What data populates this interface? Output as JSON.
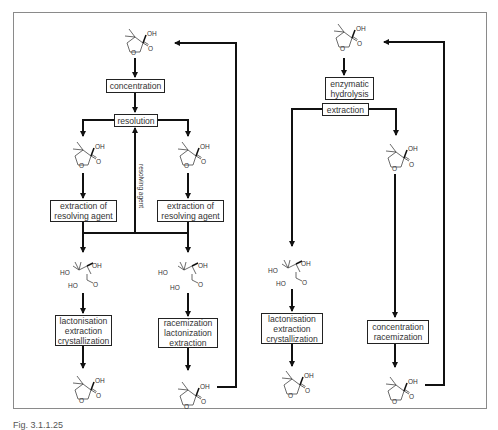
{
  "figure": {
    "caption": "Fig. 3.1.1.25",
    "colors": {
      "frame": "#8a8a8a",
      "lines": "#111111",
      "text": "#333333"
    }
  },
  "left_route": {
    "start_molecule": "racemic pantolactone",
    "steps": {
      "concentration": "concentration",
      "resolution": "resolution",
      "resolving_agent_label": "resolving agent",
      "extraction_left": [
        "extraction of",
        "resolving agent"
      ],
      "extraction_right": [
        "extraction of",
        "resolving agent"
      ],
      "final_left": [
        "lactonisation",
        "extraction",
        "crystallization"
      ],
      "final_right": [
        "racemization",
        "lactonization",
        "extraction"
      ]
    },
    "molecules": {
      "oh_label": "OH",
      "o_label": "O",
      "ho_label": "HO"
    }
  },
  "right_route": {
    "start_molecule": "racemic pantolactone",
    "steps": {
      "hydrolysis": [
        "enzymatic",
        "hydrolysis"
      ],
      "extraction": "extraction",
      "final_left": [
        "lactonisation",
        "extraction",
        "crystallization"
      ],
      "final_right": [
        "concentration",
        "racemization"
      ]
    }
  }
}
